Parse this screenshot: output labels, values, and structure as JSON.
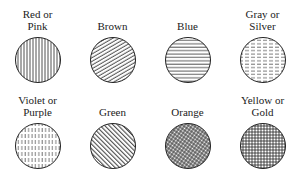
{
  "swatches": [
    {
      "line1": "Red or",
      "line2": "Pink",
      "color": "Red or Pink",
      "pattern": "vertical-lines"
    },
    {
      "line1": "",
      "line2": "Brown",
      "color": "Brown",
      "pattern": "diagonal-lines-rising"
    },
    {
      "line1": "",
      "line2": "Blue",
      "color": "Blue",
      "pattern": "horizontal-lines"
    },
    {
      "line1": "Gray or",
      "line2": "Silver",
      "color": "Gray or Silver",
      "pattern": "horizontal-dashed-lines"
    },
    {
      "line1": "Violet or",
      "line2": "Purple",
      "color": "Violet or Purple",
      "pattern": "vertical-dashed-lines"
    },
    {
      "line1": "",
      "line2": "Green",
      "color": "Green",
      "pattern": "diagonal-lines-falling"
    },
    {
      "line1": "",
      "line2": "Orange",
      "color": "Orange",
      "pattern": "diagonal-crosshatch"
    },
    {
      "line1": "Yellow or",
      "line2": "Gold",
      "color": "Yellow or Gold",
      "pattern": "grid-crosshatch"
    }
  ]
}
